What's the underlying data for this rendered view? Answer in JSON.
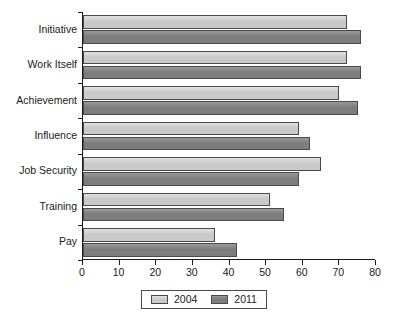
{
  "chart_data": {
    "type": "bar",
    "orientation": "horizontal",
    "title": "",
    "subtitle": "",
    "xlabel": "",
    "ylabel": "",
    "xlim": [
      0,
      80
    ],
    "xticks": [
      0,
      10,
      20,
      30,
      40,
      50,
      60,
      70,
      80
    ],
    "xtick_labels": [
      "0",
      "10",
      "20",
      "30",
      "40",
      "50",
      "60",
      "70",
      "80"
    ],
    "grid": false,
    "legend_position": "bottom-center",
    "categories": [
      "Initiative",
      "Work Itself",
      "Achievement",
      "Influence",
      "Job Security",
      "Training",
      "Pay"
    ],
    "series": [
      {
        "name": "2004",
        "color": "#c9c9c9",
        "values": [
          72,
          72,
          70,
          59,
          65,
          51,
          36
        ]
      },
      {
        "name": "2011",
        "color": "#7d7d7d",
        "values": [
          76,
          76,
          75,
          62,
          59,
          55,
          42
        ]
      }
    ]
  },
  "legend": {
    "entries": [
      {
        "label": "2004",
        "swatch_class": "y2004"
      },
      {
        "label": "2011",
        "swatch_class": "y2011"
      }
    ]
  },
  "colors": {
    "series_2004": "#c9c9c9",
    "series_2011": "#7d7d7d",
    "axis": "#1a1a1a",
    "bar_outline": "#4a4a4a",
    "background": "#ffffff"
  }
}
